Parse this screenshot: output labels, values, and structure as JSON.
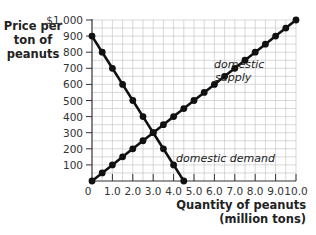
{
  "chart_data": {
    "type": "line",
    "title": "",
    "xlabel": "Quantity of peanuts (million tons)",
    "xlabel_lines": [
      "Quantity of peanuts",
      "(million tons)"
    ],
    "ylabel": "Price per ton of peanuts",
    "ylabel_lines": [
      "Price per",
      "ton of",
      "peanuts"
    ],
    "xlim": [
      0,
      10
    ],
    "ylim": [
      0,
      1000
    ],
    "x_ticks": [
      "0",
      "1.0",
      "2.0",
      "3.0",
      "4.0",
      "5.0",
      "6.0",
      "7.0",
      "8.0",
      "9.0",
      "10.0"
    ],
    "y_ticks": [
      "$1,000",
      "900",
      "800",
      "700",
      "600",
      "500",
      "400",
      "300",
      "200",
      "100"
    ],
    "grid": true,
    "legend": "inline labels on curves",
    "series": [
      {
        "name": "domestic demand",
        "x": [
          0,
          0.5,
          1.0,
          1.5,
          2.0,
          2.5,
          3.0,
          3.5,
          4.0,
          4.5
        ],
        "y": [
          900,
          800,
          700,
          600,
          500,
          400,
          300,
          200,
          100,
          0
        ]
      },
      {
        "name": "domestic supply",
        "x": [
          0,
          0.5,
          1.0,
          1.5,
          2.0,
          2.5,
          3.0,
          3.5,
          4.0,
          4.5,
          5.0,
          5.5,
          6.0,
          6.5,
          7.0,
          7.5,
          8.0,
          8.5,
          9.0,
          9.5,
          10.0
        ],
        "y": [
          0,
          50,
          100,
          150,
          200,
          250,
          300,
          350,
          400,
          450,
          500,
          550,
          600,
          650,
          700,
          750,
          800,
          850,
          900,
          950,
          1000
        ]
      }
    ],
    "annotations": [
      {
        "text": "domestic supply",
        "lines": [
          "domestic",
          "supply"
        ],
        "near": [
          7.5,
          620
        ]
      },
      {
        "text": "domestic demand",
        "near": [
          5.3,
          130
        ]
      }
    ],
    "colors": {
      "line": "#111111",
      "grid": "#bdbdbd",
      "axis": "#333333"
    }
  }
}
